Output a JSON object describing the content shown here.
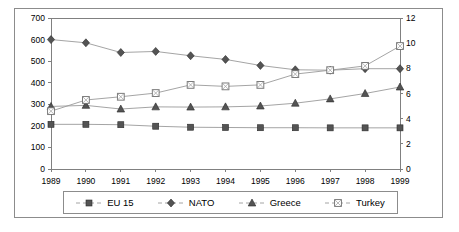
{
  "chart_data": {
    "type": "line",
    "title": "",
    "xlabel": "",
    "ylabel": "",
    "y2label": "",
    "grid": false,
    "legend_position": "bottom",
    "categories": [
      "1989",
      "1990",
      "1991",
      "1992",
      "1993",
      "1994",
      "1995",
      "1996",
      "1997",
      "1998",
      "1999"
    ],
    "x": [
      1989,
      1990,
      1991,
      1992,
      1993,
      1994,
      1995,
      1996,
      1997,
      1998,
      1999
    ],
    "ylim": [
      0,
      700
    ],
    "y_ticks": [
      0,
      100,
      200,
      300,
      400,
      500,
      600,
      700
    ],
    "y2lim": [
      0,
      12
    ],
    "y2_ticks": [
      0,
      2,
      4,
      6,
      8,
      10,
      12
    ],
    "series": [
      {
        "name": "EU 15",
        "axis": "right",
        "marker": "filled-square",
        "values": [
          3.55,
          3.55,
          3.52,
          3.4,
          3.32,
          3.3,
          3.28,
          3.28,
          3.27,
          3.27,
          3.27
        ],
        "values_left_scale": [
          207,
          207,
          205,
          198,
          194,
          192,
          191,
          191,
          191,
          191,
          191
        ]
      },
      {
        "name": "NATO",
        "axis": "left",
        "marker": "filled-diamond",
        "values": [
          600,
          585,
          540,
          545,
          525,
          508,
          480,
          460,
          458,
          465,
          465
        ],
        "values_right_scale": [
          10.3,
          10.0,
          9.3,
          9.3,
          9.0,
          8.7,
          8.2,
          7.9,
          7.85,
          7.95,
          7.95
        ]
      },
      {
        "name": "Greece",
        "axis": "left",
        "marker": "filled-triangle",
        "values": [
          290,
          295,
          278,
          288,
          287,
          288,
          292,
          305,
          325,
          350,
          380
        ],
        "values_right_scale": [
          4.97,
          5.05,
          4.77,
          4.93,
          4.92,
          4.94,
          5.0,
          5.22,
          5.57,
          6.0,
          6.52
        ]
      },
      {
        "name": "Turkey",
        "axis": "left",
        "marker": "open-square",
        "values": [
          268,
          320,
          335,
          352,
          390,
          383,
          390,
          440,
          458,
          478,
          570
        ],
        "values_right_scale": [
          4.59,
          5.49,
          5.74,
          6.03,
          6.69,
          6.57,
          6.69,
          7.54,
          7.85,
          8.19,
          9.77
        ]
      }
    ]
  },
  "legend": {
    "items": [
      {
        "label": "EU 15",
        "marker": "filled-square"
      },
      {
        "label": "NATO",
        "marker": "filled-diamond"
      },
      {
        "label": "Greece",
        "marker": "filled-triangle"
      },
      {
        "label": "Turkey",
        "marker": "open-square"
      }
    ]
  },
  "colors": {
    "line": "#9a9a9a",
    "marker_fill": "#545454",
    "marker_stroke": "#2a2a2a",
    "axis": "#808080",
    "frame": "#8c8c8c",
    "background": "#ffffff",
    "text": "#000000"
  }
}
